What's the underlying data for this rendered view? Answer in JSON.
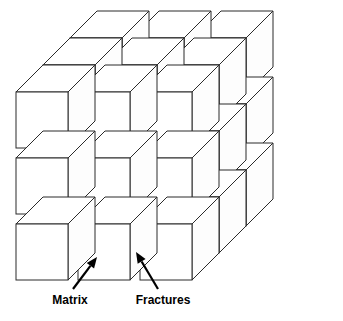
{
  "figure": {
    "background_color": "#ffffff",
    "line_color": "#2b2b2b",
    "face_color": "#ffffff",
    "label_color": "#000000"
  },
  "geometry": {
    "columns": 3,
    "rows": 3,
    "layers": 3,
    "face_width": 52,
    "face_height": 56,
    "column_pitch": 62,
    "row_pitch": 66,
    "depth_dx": 27,
    "depth_dy": -27,
    "origin_x": 16,
    "origin_y": 92
  },
  "labels": [
    {
      "id": "matrix",
      "text": "Matrix",
      "text_x": 70,
      "text_y": 301,
      "anchor": "middle",
      "leader_start_x": 73,
      "leader_start_y": 289,
      "leader_end_x": 97,
      "leader_end_y": 257,
      "arrow_angle_deg": -53
    },
    {
      "id": "fractures",
      "text": "Fractures",
      "text_x": 163,
      "text_y": 301,
      "anchor": "middle",
      "leader_start_x": 158,
      "leader_start_y": 289,
      "leader_end_x": 136,
      "leader_end_y": 252,
      "arrow_angle_deg": 239
    }
  ]
}
